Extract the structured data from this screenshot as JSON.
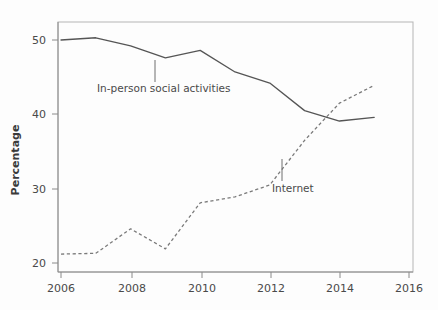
{
  "chart_data": {
    "type": "line",
    "title": "",
    "xlabel": "",
    "ylabel": "Percentage",
    "xlim": [
      2006,
      2016
    ],
    "ylim": [
      20,
      52
    ],
    "grid": false,
    "legend_position": "inline-annotations",
    "xticks": [
      2006,
      2008,
      2010,
      2012,
      2014,
      2016
    ],
    "xtick_labels": [
      "2006",
      "2008",
      "2010",
      "2012",
      "2014",
      "2016"
    ],
    "yticks": [
      20,
      30,
      40,
      50
    ],
    "ytick_labels": [
      "20",
      "30",
      "40",
      "50"
    ],
    "x": [
      2006,
      2007,
      2008,
      2009,
      2010,
      2011,
      2012,
      2013,
      2014,
      2015
    ],
    "series": [
      {
        "name": "In-person social activities",
        "style": "solid",
        "color": "#555555",
        "values": [
          50.0,
          50.3,
          49.2,
          47.6,
          48.6,
          45.7,
          44.2,
          40.5,
          39.1,
          39.6
        ],
        "annotation": {
          "label": "In-person social activities",
          "label_x": 97,
          "label_y": 92,
          "leader_x": 155,
          "leader_y_top": 60,
          "leader_y_bottom": 82
        }
      },
      {
        "name": "Internet",
        "style": "dashed",
        "color": "#7a7a7a",
        "values": [
          21.2,
          21.3,
          24.6,
          21.9,
          28.1,
          28.9,
          30.5,
          36.5,
          41.5,
          43.9
        ],
        "annotation": {
          "label": "Internet",
          "label_x": 272,
          "label_y": 192,
          "leader_x": 282,
          "leader_y_top": 159,
          "leader_y_bottom": 181
        }
      }
    ]
  },
  "axes": {
    "y_axis_label": "Percentage",
    "tick_labels_y": [
      "50",
      "40",
      "30",
      "20"
    ],
    "tick_labels_x": [
      "2006",
      "2008",
      "2010",
      "2012",
      "2014",
      "2016"
    ]
  }
}
